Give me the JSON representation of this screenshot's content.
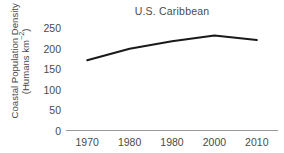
{
  "chart_data": {
    "type": "line",
    "title": "U.S. Caribbean",
    "xlabel": "",
    "ylabel_line1": "Coastal Population Density",
    "ylabel_line2_prefix": "(Humans km",
    "ylabel_line2_exponent": "−2",
    "ylabel_line2_suffix": ")",
    "categories": [
      "1970",
      "1980",
      "1980",
      "2000",
      "2010"
    ],
    "x": [
      1970,
      1980,
      1990,
      2000,
      2010
    ],
    "values": [
      172,
      200,
      218,
      232,
      221
    ],
    "series": [
      {
        "name": "Coastal Population Density",
        "values": [
          172,
          200,
          218,
          232,
          221
        ],
        "color": "#1a1a1a"
      }
    ],
    "xtick_labels": [
      "1970",
      "1980",
      "1980",
      "2000",
      "2010"
    ],
    "ytick_labels": [
      "0",
      "50",
      "100",
      "150",
      "200",
      "250"
    ],
    "ytick_values": [
      0,
      50,
      100,
      150,
      200,
      250
    ],
    "ylim": [
      0,
      260
    ],
    "xlim": [
      1965,
      2015
    ],
    "grid": false,
    "legend": "none",
    "axis_color": "#9a9a9a",
    "text_color": "#4a4a4a",
    "line_color": "#1a1a1a",
    "background": "#ffffff"
  }
}
